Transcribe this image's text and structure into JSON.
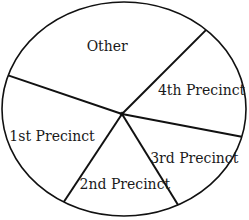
{
  "chart_data": {
    "type": "pie",
    "title": "",
    "start_angle_deg": -45,
    "direction": "clockwise",
    "slices": [
      {
        "label": "4th Precinct",
        "value": 15.5
      },
      {
        "label": "3rd Precinct",
        "value": 13.2
      },
      {
        "label": "2nd Precinct",
        "value": 18.1
      },
      {
        "label": "1st Precinct",
        "value": 20.9
      },
      {
        "label": "Other",
        "value": 32.3
      }
    ],
    "value_units": "percent (estimated from slice angles; no values printed)",
    "legend": "none",
    "colors": {
      "fill": "#ffffff",
      "stroke": "#111111",
      "text": "#1a1a1a"
    }
  }
}
